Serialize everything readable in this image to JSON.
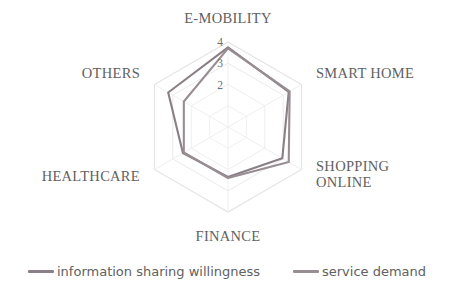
{
  "chart_data": {
    "type": "radar",
    "title": "",
    "categories": [
      "E-MOBILITY",
      "SMART HOME",
      "SHOPPING ONLINE",
      "FINANCE",
      "HEALTHCARE",
      "OTHERS"
    ],
    "tick_labels": [
      "4",
      "3",
      "2"
    ],
    "tick_values": [
      4,
      3,
      2
    ],
    "rmin": 0,
    "rmax": 4,
    "grid": true,
    "grid_shape": "hexagon",
    "legend_position": "bottom",
    "series": [
      {
        "name": "information sharing willingness",
        "color": "#8a7f86",
        "values": [
          3.75,
          3.3,
          2.95,
          2.35,
          2.45,
          3.25
        ]
      },
      {
        "name": "service demand",
        "color": "#998d94",
        "values": [
          3.7,
          3.35,
          3.3,
          2.4,
          2.4,
          2.4
        ]
      }
    ]
  },
  "axis_labels": {
    "e_mobility": "E-MOBILITY",
    "smart_home": "SMART HOME",
    "shopping_online": "SHOPPING\nONLINE",
    "finance": "FINANCE",
    "healthcare": "HEALTHCARE",
    "others": "OTHERS"
  },
  "ticks": {
    "t4": "4",
    "t3": "3",
    "t2": "2"
  },
  "legend": {
    "items": [
      {
        "label": "information sharing willingness",
        "color": "#8a7f86"
      },
      {
        "label": "service demand",
        "color": "#998d94"
      }
    ]
  },
  "colors": {
    "grid": "#e3e1e2",
    "series1": "#8a7f86",
    "series2": "#998d94",
    "text": "#616161",
    "background": "#ffffff"
  }
}
